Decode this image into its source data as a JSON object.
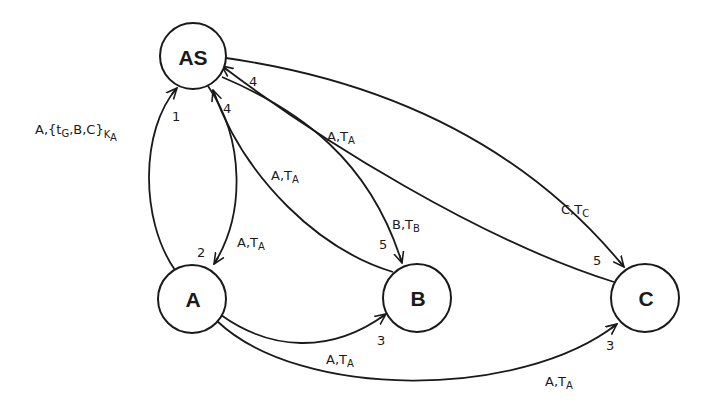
{
  "nodes": {
    "AS": {
      "label": "AS",
      "cx": 193,
      "cy": 56,
      "r": 33
    },
    "A": {
      "label": "A",
      "cx": 192,
      "cy": 299,
      "r": 34
    },
    "B": {
      "label": "B",
      "cx": 417,
      "cy": 298,
      "r": 34
    },
    "C": {
      "label": "C",
      "cx": 645,
      "cy": 298,
      "r": 34
    }
  },
  "edges": {
    "a_to_as": {
      "from": "A",
      "to": "AS",
      "seq": "1",
      "msg_main": "A,{t",
      "msg_sub1": "G",
      "msg_mid": ",B,C}",
      "msg_sub2": "K",
      "msg_sub3": "A"
    },
    "as_to_a": {
      "from": "AS",
      "to": "A",
      "seq": "2",
      "msg_main": "A,T",
      "msg_sub": "A"
    },
    "a_to_b": {
      "from": "A",
      "to": "B",
      "seq": "3",
      "msg_main": "A,T",
      "msg_sub": "A"
    },
    "a_to_c": {
      "from": "A",
      "to": "C",
      "seq": "3",
      "msg_main": "A,T",
      "msg_sub": "A"
    },
    "b_to_as": {
      "from": "B",
      "to": "AS",
      "seq": "4",
      "msg_main": "A,T",
      "msg_sub": "A"
    },
    "c_to_as": {
      "from": "C",
      "to": "AS",
      "seq": "4",
      "msg_main": "A,T",
      "msg_sub": "A"
    },
    "as_to_b": {
      "from": "AS",
      "to": "B",
      "seq": "5",
      "msg_main": "B,T",
      "msg_sub": "B"
    },
    "as_to_c": {
      "from": "AS",
      "to": "C",
      "seq": "5",
      "msg_main": "C,T",
      "msg_sub": "C"
    }
  },
  "colors": {
    "stroke": "#1a1a1a",
    "background": "#ffffff"
  }
}
